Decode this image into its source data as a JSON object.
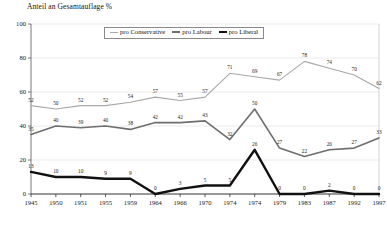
{
  "chart_data": {
    "type": "line",
    "title": "Anteil an Gesamtauflage %",
    "xlabel": "",
    "ylabel": "",
    "ylim": [
      0,
      100
    ],
    "yticks": [
      0,
      20,
      40,
      60,
      80,
      100
    ],
    "grid": true,
    "legend_position": "top-center",
    "categories": [
      "1945",
      "1950",
      "1951",
      "1955",
      "1959",
      "1964",
      "1966",
      "1970",
      "1974",
      "1974",
      "1979",
      "1983",
      "1987",
      "1992",
      "1997"
    ],
    "series": [
      {
        "name": "pro Conservative",
        "color": "#a8a8a8",
        "values": [
          52,
          50,
          52,
          52,
          54,
          57,
          55,
          57,
          71,
          69,
          67,
          78,
          74,
          70,
          62
        ]
      },
      {
        "name": "pro Labour",
        "color": "#6e6e6e",
        "values": [
          35,
          40,
          39,
          40,
          38,
          42,
          42,
          43,
          32,
          50,
          27,
          22,
          26,
          27,
          33
        ]
      },
      {
        "name": "pro Liberal",
        "color": "#111111",
        "values": [
          13,
          10,
          10,
          9,
          9,
          0,
          3,
          5,
          5,
          26,
          0,
          0,
          2,
          0,
          0
        ]
      }
    ]
  },
  "legend": {
    "items": [
      {
        "label": "pro Conservative"
      },
      {
        "label": "pro Labour"
      },
      {
        "label": "pro Liberal"
      }
    ]
  }
}
